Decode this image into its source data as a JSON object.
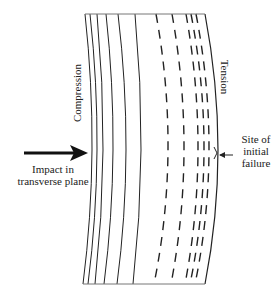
{
  "labels": {
    "compression": "Compression",
    "tension": "Tension",
    "impact_line1": "Impact in",
    "impact_line2": "transverse plane",
    "site_line1": "Site of",
    "site_line2": "initial",
    "site_line3": "failure"
  },
  "colors": {
    "line": "#222222",
    "background": "#ffffff"
  },
  "geometry": {
    "top_y": 14,
    "bottom_y": 284,
    "mid_y": 150,
    "solid_lines": [
      {
        "top_x": 85,
        "mid_x": 92,
        "bottom_x": 83
      },
      {
        "top_x": 90,
        "mid_x": 97,
        "bottom_x": 88
      },
      {
        "top_x": 97,
        "mid_x": 103,
        "bottom_x": 95
      },
      {
        "top_x": 106,
        "mid_x": 113,
        "bottom_x": 104
      },
      {
        "top_x": 118,
        "mid_x": 126,
        "bottom_x": 117
      },
      {
        "top_x": 135,
        "mid_x": 141,
        "bottom_x": 133
      }
    ],
    "dashed_lines": [
      {
        "top_x": 156,
        "mid_x": 168,
        "bottom_x": 154
      },
      {
        "top_x": 172,
        "mid_x": 184,
        "bottom_x": 171
      },
      {
        "top_x": 186,
        "mid_x": 198,
        "bottom_x": 185
      },
      {
        "top_x": 191,
        "mid_x": 204,
        "bottom_x": 190
      },
      {
        "top_x": 196,
        "mid_x": 209,
        "bottom_x": 195
      }
    ],
    "outer_edge": {
      "top_x": 205,
      "mid_x": 218,
      "bottom_x": 205
    }
  }
}
